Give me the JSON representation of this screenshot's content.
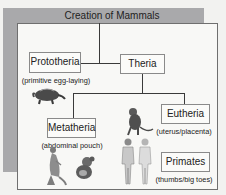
{
  "title": "Creation of Mammals",
  "nodes": {
    "prototheria": {
      "label": "Prototheria",
      "note": "(primitive egg-laying)"
    },
    "theria": {
      "label": "Theria"
    },
    "metatheria": {
      "label": "Metatheria",
      "note": "(abdominal pouch)"
    },
    "eutheria": {
      "label": "Eutheria",
      "note": "(uterus/placenta)"
    },
    "primates": {
      "label": "Primates",
      "note": "(thumbs/big toes)"
    }
  },
  "illustrations": [
    "anteater-echidna",
    "kangaroo",
    "koala",
    "monkey",
    "human-male",
    "human-female"
  ],
  "colors": {
    "frame": "#a9a9ab",
    "background": "#f8f8f6",
    "lines": "#3a3a3a"
  }
}
